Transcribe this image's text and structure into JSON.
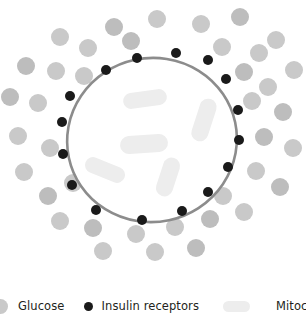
{
  "diagram": {
    "colors": {
      "glucose": "#c9c9c9",
      "glucose_alt": "#bdbdbd",
      "receptor": "#1a1a1a",
      "membrane": "#8c8c8c",
      "cytoplasm": "#ffffff",
      "mitochondria": "#ededed",
      "label_text": "#231f20",
      "background": "#ffffff"
    },
    "cell": {
      "name": "cell-body",
      "center_x": 152,
      "center_y": 140,
      "radius_x": 85,
      "radius_y": 82,
      "rotation_deg": -12,
      "membrane_width": 2.6
    },
    "glucose_particles": [
      {
        "x": 60,
        "y": 37,
        "r": 9
      },
      {
        "x": 114,
        "y": 27,
        "r": 9
      },
      {
        "x": 157,
        "y": 19,
        "r": 9
      },
      {
        "x": 201,
        "y": 24,
        "r": 9
      },
      {
        "x": 240,
        "y": 17,
        "r": 9
      },
      {
        "x": 276,
        "y": 40,
        "r": 9
      },
      {
        "x": 88,
        "y": 48,
        "r": 9
      },
      {
        "x": 131,
        "y": 41,
        "r": 9
      },
      {
        "x": 222,
        "y": 47,
        "r": 9
      },
      {
        "x": 259,
        "y": 53,
        "r": 9
      },
      {
        "x": 26,
        "y": 66,
        "r": 9
      },
      {
        "x": 56,
        "y": 71,
        "r": 9
      },
      {
        "x": 84,
        "y": 76,
        "r": 9
      },
      {
        "x": 244,
        "y": 72,
        "r": 9
      },
      {
        "x": 268,
        "y": 87,
        "r": 9
      },
      {
        "x": 294,
        "y": 70,
        "r": 9
      },
      {
        "x": 10,
        "y": 97,
        "r": 9
      },
      {
        "x": 38,
        "y": 103,
        "r": 9
      },
      {
        "x": 252,
        "y": 101,
        "r": 9
      },
      {
        "x": 283,
        "y": 112,
        "r": 9
      },
      {
        "x": 18,
        "y": 136,
        "r": 9
      },
      {
        "x": 50,
        "y": 148,
        "r": 9
      },
      {
        "x": 264,
        "y": 137,
        "r": 9
      },
      {
        "x": 293,
        "y": 148,
        "r": 9
      },
      {
        "x": 24,
        "y": 172,
        "r": 9
      },
      {
        "x": 48,
        "y": 196,
        "r": 9
      },
      {
        "x": 73,
        "y": 183,
        "r": 9
      },
      {
        "x": 256,
        "y": 171,
        "r": 9
      },
      {
        "x": 280,
        "y": 187,
        "r": 9
      },
      {
        "x": 223,
        "y": 196,
        "r": 9
      },
      {
        "x": 60,
        "y": 221,
        "r": 9
      },
      {
        "x": 93,
        "y": 228,
        "r": 9
      },
      {
        "x": 136,
        "y": 234,
        "r": 9
      },
      {
        "x": 175,
        "y": 227,
        "r": 9
      },
      {
        "x": 210,
        "y": 219,
        "r": 9
      },
      {
        "x": 244,
        "y": 212,
        "r": 9
      },
      {
        "x": 118,
        "y": 204,
        "r": 9
      },
      {
        "x": 196,
        "y": 248,
        "r": 9
      },
      {
        "x": 155,
        "y": 252,
        "r": 9
      },
      {
        "x": 103,
        "y": 251,
        "r": 9
      }
    ],
    "insulin_receptors": [
      {
        "x": 176,
        "y": 53,
        "r": 5
      },
      {
        "x": 137,
        "y": 58,
        "r": 5
      },
      {
        "x": 208,
        "y": 60,
        "r": 5
      },
      {
        "x": 106,
        "y": 70,
        "r": 5
      },
      {
        "x": 226,
        "y": 79,
        "r": 5
      },
      {
        "x": 70,
        "y": 96,
        "r": 5
      },
      {
        "x": 238,
        "y": 110,
        "r": 5
      },
      {
        "x": 62,
        "y": 122,
        "r": 5
      },
      {
        "x": 239,
        "y": 140,
        "r": 5
      },
      {
        "x": 63,
        "y": 154,
        "r": 5
      },
      {
        "x": 228,
        "y": 167,
        "r": 5
      },
      {
        "x": 72,
        "y": 185,
        "r": 5
      },
      {
        "x": 208,
        "y": 192,
        "r": 5
      },
      {
        "x": 96,
        "y": 210,
        "r": 5
      },
      {
        "x": 182,
        "y": 211,
        "r": 5
      },
      {
        "x": 142,
        "y": 220,
        "r": 5
      }
    ],
    "mitochondria": [
      {
        "cx": 145,
        "cy": 99,
        "w": 44,
        "h": 16,
        "angle": -8
      },
      {
        "cx": 204,
        "cy": 120,
        "w": 44,
        "h": 17,
        "angle": -72
      },
      {
        "cx": 144,
        "cy": 144,
        "w": 48,
        "h": 18,
        "angle": -4
      },
      {
        "cx": 105,
        "cy": 170,
        "w": 42,
        "h": 16,
        "angle": 22
      },
      {
        "cx": 168,
        "cy": 177,
        "w": 40,
        "h": 17,
        "angle": -72
      }
    ]
  },
  "legend": {
    "items": [
      {
        "id": "glucose",
        "label": "Glucose",
        "swatch": "glucose-dot-swatch",
        "color": "#c9c9c9"
      },
      {
        "id": "insulin-receptors",
        "label": "Insulin receptors",
        "swatch": "receptor-dot-swatch",
        "color": "#1a1a1a"
      },
      {
        "id": "mitochondria",
        "label": "Mitochondria",
        "swatch": "mitochondria-capsule-swatch",
        "color": "#ededed"
      }
    ]
  }
}
